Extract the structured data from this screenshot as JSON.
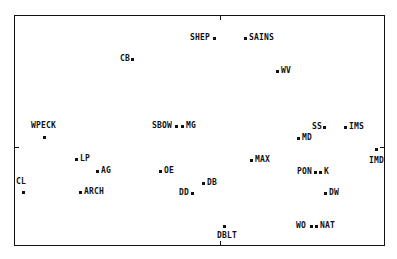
{
  "chart_data": {
    "type": "scatter",
    "title": "",
    "xlabel": "",
    "ylabel": "",
    "grid": false,
    "legend": "none",
    "axes_origin_ticks": {
      "x_px": 220,
      "y_px": 147
    },
    "points": [
      {
        "label": "SHEP",
        "px": 214,
        "py": 38,
        "lx": 190,
        "ly": 34,
        "side": "left"
      },
      {
        "label": "SAINS",
        "px": 245,
        "py": 38,
        "lx": 249,
        "ly": 34,
        "side": "right"
      },
      {
        "label": "CB",
        "px": 132,
        "py": 59,
        "lx": 120,
        "ly": 55,
        "side": "left"
      },
      {
        "label": "WV",
        "px": 277,
        "py": 71,
        "lx": 281,
        "ly": 67,
        "side": "right"
      },
      {
        "label": "WPECK",
        "px": 44,
        "py": 137,
        "lx": 31,
        "ly": 122,
        "side": "above"
      },
      {
        "label": "SBOW",
        "px": 176,
        "py": 126,
        "lx": 152,
        "ly": 122,
        "side": "left"
      },
      {
        "label": "MG",
        "px": 182,
        "py": 126,
        "lx": 186,
        "ly": 122,
        "side": "right"
      },
      {
        "label": "SS",
        "px": 324,
        "py": 127,
        "lx": 312,
        "ly": 123,
        "side": "left"
      },
      {
        "label": "IMS",
        "px": 345,
        "py": 127,
        "lx": 349,
        "ly": 123,
        "side": "right"
      },
      {
        "label": "MD",
        "px": 298,
        "py": 138,
        "lx": 302,
        "ly": 134,
        "side": "right"
      },
      {
        "label": "IMD",
        "px": 376,
        "py": 149,
        "lx": 369,
        "ly": 157,
        "side": "below"
      },
      {
        "label": "LP",
        "px": 76,
        "py": 159,
        "lx": 80,
        "ly": 155,
        "side": "right"
      },
      {
        "label": "MAX",
        "px": 251,
        "py": 160,
        "lx": 255,
        "ly": 156,
        "side": "right"
      },
      {
        "label": "AG",
        "px": 97,
        "py": 171,
        "lx": 101,
        "ly": 167,
        "side": "right"
      },
      {
        "label": "OE",
        "px": 160,
        "py": 171,
        "lx": 164,
        "ly": 167,
        "side": "right"
      },
      {
        "label": "PON",
        "px": 315,
        "py": 172,
        "lx": 297,
        "ly": 168,
        "side": "left"
      },
      {
        "label": "K",
        "px": 320,
        "py": 172,
        "lx": 324,
        "ly": 168,
        "side": "right"
      },
      {
        "label": "DB",
        "px": 203,
        "py": 183,
        "lx": 207,
        "ly": 179,
        "side": "right"
      },
      {
        "label": "CL",
        "px": 23,
        "py": 192,
        "lx": 16,
        "ly": 178,
        "side": "above"
      },
      {
        "label": "ARCH",
        "px": 80,
        "py": 192,
        "lx": 84,
        "ly": 188,
        "side": "right"
      },
      {
        "label": "DD",
        "px": 192,
        "py": 193,
        "lx": 179,
        "ly": 189,
        "side": "left"
      },
      {
        "label": "DW",
        "px": 325,
        "py": 193,
        "lx": 329,
        "ly": 189,
        "side": "right"
      },
      {
        "label": "DBLT",
        "px": 224,
        "py": 226,
        "lx": 217,
        "ly": 232,
        "side": "below"
      },
      {
        "label": "WO",
        "px": 311,
        "py": 226,
        "lx": 296,
        "ly": 222,
        "side": "left"
      },
      {
        "label": "NAT",
        "px": 316,
        "py": 226,
        "lx": 320,
        "ly": 222,
        "side": "right"
      }
    ]
  }
}
